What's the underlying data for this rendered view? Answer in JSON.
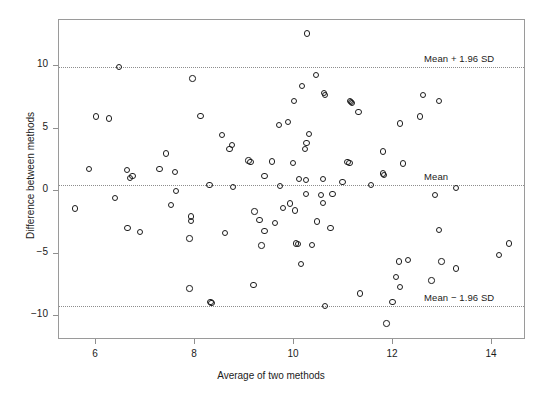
{
  "chart_data": {
    "type": "scatter",
    "title": "",
    "xlabel": "Average of two methods",
    "ylabel": "Difference between methods",
    "xlim": [
      5.25,
      14.75
    ],
    "ylim": [
      -12.2,
      13.2
    ],
    "xticks": [
      6,
      8,
      10,
      12,
      14
    ],
    "xtick_labels": [
      "6",
      "8",
      "10",
      "12",
      "14"
    ],
    "yticks": [
      10,
      5,
      0,
      -5,
      -10
    ],
    "ytick_labels": [
      "10",
      "5",
      "0",
      "−5",
      "−10"
    ],
    "grid": false,
    "legend": "none",
    "reference_lines": [
      {
        "name": "upper-limit-of-agreement",
        "label": "Mean + 1.96 SD",
        "value": 9.9
      },
      {
        "name": "mean",
        "label": "Mean",
        "value": 0.45
      },
      {
        "name": "lower-limit-of-agreement",
        "label": "Mean − 1.96 SD",
        "value": -9.2
      }
    ],
    "marker": {
      "shape": "open-circle",
      "size": 6,
      "color": "#1c1c1c",
      "fill": "none"
    },
    "points": [
      [
        6.46,
        9.9
      ],
      [
        7.95,
        9.0
      ],
      [
        10.26,
        12.6
      ],
      [
        6.0,
        5.95
      ],
      [
        6.26,
        5.8
      ],
      [
        8.11,
        6.0
      ],
      [
        10.44,
        9.3
      ],
      [
        10.16,
        8.4
      ],
      [
        10.6,
        7.85
      ],
      [
        10.0,
        7.2
      ],
      [
        11.13,
        7.2
      ],
      [
        10.63,
        7.7
      ],
      [
        11.15,
        7.1
      ],
      [
        11.17,
        7.05
      ],
      [
        12.6,
        7.7
      ],
      [
        12.93,
        7.2
      ],
      [
        12.54,
        5.95
      ],
      [
        12.14,
        5.4
      ],
      [
        9.7,
        5.3
      ],
      [
        9.88,
        5.5
      ],
      [
        11.3,
        6.3
      ],
      [
        7.42,
        3.0
      ],
      [
        5.86,
        1.75
      ],
      [
        6.63,
        1.7
      ],
      [
        6.74,
        1.2
      ],
      [
        7.28,
        1.75
      ],
      [
        7.6,
        1.5
      ],
      [
        10.3,
        4.55
      ],
      [
        10.25,
        3.85
      ],
      [
        10.22,
        3.35
      ],
      [
        11.08,
        2.3
      ],
      [
        11.12,
        2.25
      ],
      [
        11.8,
        3.15
      ],
      [
        12.2,
        2.2
      ],
      [
        8.55,
        4.5
      ],
      [
        8.75,
        3.7
      ],
      [
        8.7,
        3.35
      ],
      [
        9.08,
        2.45
      ],
      [
        9.12,
        2.3
      ],
      [
        9.55,
        2.35
      ],
      [
        9.98,
        2.25
      ],
      [
        9.4,
        1.2
      ],
      [
        11.8,
        1.4
      ],
      [
        11.82,
        1.3
      ],
      [
        10.1,
        0.95
      ],
      [
        10.24,
        0.9
      ],
      [
        10.58,
        0.95
      ],
      [
        10.98,
        0.7
      ],
      [
        8.29,
        0.5
      ],
      [
        8.77,
        0.3
      ],
      [
        9.72,
        0.4
      ],
      [
        6.69,
        1.05
      ],
      [
        7.62,
        0.0
      ],
      [
        11.56,
        0.5
      ],
      [
        13.27,
        0.25
      ],
      [
        10.24,
        -0.25
      ],
      [
        10.54,
        -0.3
      ],
      [
        10.78,
        -0.25
      ],
      [
        10.58,
        -0.95
      ],
      [
        12.85,
        -0.3
      ],
      [
        6.38,
        -0.55
      ],
      [
        5.58,
        -1.4
      ],
      [
        7.51,
        -1.1
      ],
      [
        9.2,
        -1.65
      ],
      [
        9.78,
        -1.35
      ],
      [
        9.92,
        -1.0
      ],
      [
        6.64,
        -2.95
      ],
      [
        6.89,
        -3.3
      ],
      [
        7.92,
        -2.05
      ],
      [
        7.92,
        -2.4
      ],
      [
        7.89,
        -3.8
      ],
      [
        9.4,
        -3.2
      ],
      [
        10.46,
        -2.45
      ],
      [
        10.74,
        -2.95
      ],
      [
        9.34,
        -4.35
      ],
      [
        10.04,
        -4.2
      ],
      [
        10.08,
        -4.25
      ],
      [
        10.36,
        -4.3
      ],
      [
        12.93,
        -3.1
      ],
      [
        10.14,
        -5.85
      ],
      [
        9.18,
        -7.5
      ],
      [
        7.89,
        -7.8
      ],
      [
        8.31,
        -8.9
      ],
      [
        8.33,
        -8.95
      ],
      [
        10.62,
        -9.2
      ],
      [
        12.3,
        -5.5
      ],
      [
        12.12,
        -5.65
      ],
      [
        12.98,
        -5.65
      ],
      [
        13.27,
        -6.2
      ],
      [
        14.34,
        -4.2
      ],
      [
        14.14,
        -5.1
      ],
      [
        12.06,
        -6.9
      ],
      [
        12.78,
        -7.15
      ],
      [
        12.14,
        -7.7
      ],
      [
        11.33,
        -8.2
      ],
      [
        11.99,
        -8.9
      ],
      [
        11.87,
        -10.6
      ],
      [
        8.6,
        -3.35
      ],
      [
        9.3,
        -2.3
      ],
      [
        9.62,
        -2.55
      ],
      [
        10.02,
        -1.55
      ]
    ]
  }
}
